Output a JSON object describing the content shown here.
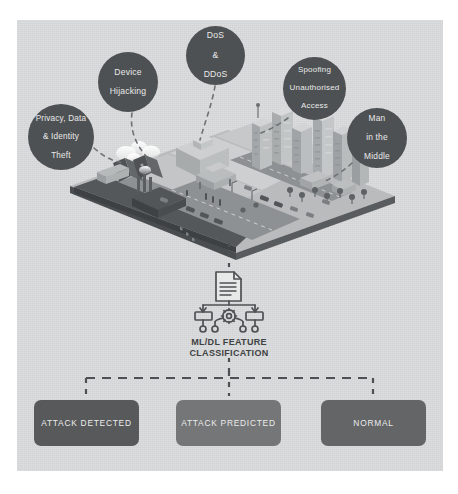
{
  "diagram": {
    "panel_color": "#d9dadb",
    "bubble_color": "#4e5153",
    "threats": [
      {
        "id": "privacy",
        "label": "Privacy, Data\n& Identity\nTheft",
        "lines": [
          "Privacy, Data",
          "& Identity",
          "Theft"
        ]
      },
      {
        "id": "device",
        "label": "Device Hijacking",
        "lines": [
          "Device",
          "Hijacking"
        ]
      },
      {
        "id": "dos",
        "label": "DoS & DDoS",
        "lines": [
          "DoS",
          "&",
          "DDoS"
        ]
      },
      {
        "id": "spoofing",
        "label": "Spoofing Unauthorised Access",
        "lines": [
          "Spoofing",
          "Unauthorised",
          "Access"
        ]
      },
      {
        "id": "mitm",
        "label": "Man in the Middle",
        "lines": [
          "Man",
          "in the",
          "Middle"
        ]
      }
    ],
    "scene": {
      "name": "isometric-smart-city",
      "description": "Isometric smart city platform with factories, roads, office and high-rise buildings, vehicles and people"
    },
    "classifier": {
      "icon": "ml-classification-icon",
      "label_line1": "ML/DL FEATURE",
      "label_line2": "CLASSIFICATION"
    },
    "outcomes": [
      {
        "id": "attack-detected",
        "label": "ATTACK DETECTED",
        "color": "#58595b"
      },
      {
        "id": "attack-predicted",
        "label": "ATTACK PREDICTED",
        "color": "#747677"
      },
      {
        "id": "normal",
        "label": "NORMAL",
        "color": "#636567"
      }
    ]
  }
}
